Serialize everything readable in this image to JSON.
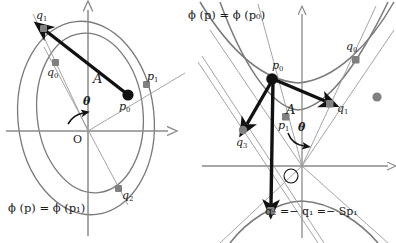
{
  "figure": {
    "caption_left": "ϕ (p) = ϕ (p₁)",
    "caption_right": "ϕ (p) = ϕ (p₀)",
    "bottom_equation": "q₂ =− q₁ =− Sp₁"
  },
  "colors": {
    "curve": "#7a7a7a",
    "axis": "#8a8a8a",
    "line": "#9a9a9a",
    "marker": "#808080",
    "vector": "#111111",
    "text": "#1a1a1a",
    "background": "#ffffff"
  },
  "left_panel": {
    "name": "elliptic-level-sets",
    "origin_label": "O",
    "angle_label": "θ",
    "vector_label": "A",
    "caption": "ϕ (p) = ϕ (p₁)",
    "points": [
      {
        "id": "q1",
        "label": "q",
        "sub": "1",
        "x": 43,
        "y": 28,
        "style": "gray"
      },
      {
        "id": "q0",
        "label": "q",
        "sub": "0",
        "x": 55,
        "y": 62,
        "style": "gray"
      },
      {
        "id": "p0",
        "label": "p",
        "sub": "0",
        "x": 128,
        "y": 95,
        "style": "black"
      },
      {
        "id": "p1",
        "label": "p",
        "sub": "1",
        "x": 146,
        "y": 84,
        "style": "gray"
      },
      {
        "id": "q2",
        "label": "q",
        "sub": "2",
        "x": 118,
        "y": 188,
        "style": "gray"
      }
    ],
    "vectors": [
      {
        "id": "A",
        "from": "p0",
        "to": "q1",
        "label": "A"
      }
    ]
  },
  "right_panel": {
    "name": "hyperbolic-level-sets",
    "origin_label": "Ø",
    "angle_label": "θ",
    "vector_label": "A",
    "caption": "ϕ (p) = ϕ (p₀)",
    "equation": "q₂ =− q₁ =− Sp₁",
    "points": [
      {
        "id": "p0",
        "label": "p",
        "sub": "0",
        "x": 272,
        "y": 77,
        "style": "black"
      },
      {
        "id": "q0",
        "label": "q",
        "sub": "0",
        "x": 355,
        "y": 59,
        "style": "gray"
      },
      {
        "id": "q1",
        "label": "q",
        "sub": "1",
        "x": 330,
        "y": 104,
        "style": "gray"
      },
      {
        "id": "p1",
        "label": "p",
        "sub": "1",
        "x": 285,
        "y": 116,
        "style": "gray"
      },
      {
        "id": "q3",
        "label": "q",
        "sub": "3",
        "x": 243,
        "y": 130,
        "style": "gray"
      },
      {
        "id": "q2",
        "label": "q",
        "sub": "2",
        "x": 271,
        "y": 211,
        "style": "gray"
      },
      {
        "id": "free",
        "label": "",
        "sub": "",
        "x": 377,
        "y": 97,
        "style": "gray"
      }
    ],
    "vectors": [
      {
        "id": "A",
        "from": "p0",
        "to": "q1",
        "label": "A"
      },
      {
        "id": "v3",
        "from": "p0",
        "to": "q3",
        "label": ""
      },
      {
        "id": "v2",
        "from": "p0",
        "to": "q2",
        "label": ""
      }
    ]
  }
}
